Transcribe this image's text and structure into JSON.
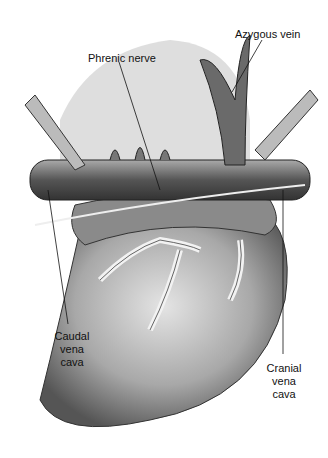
{
  "labels": {
    "azygous": "Azygous vein",
    "phrenic": "Phrenic nerve",
    "caudal": [
      "Caudal",
      "vena",
      "cava"
    ],
    "cranial": [
      "Cranial",
      "vena",
      "cava"
    ]
  }
}
